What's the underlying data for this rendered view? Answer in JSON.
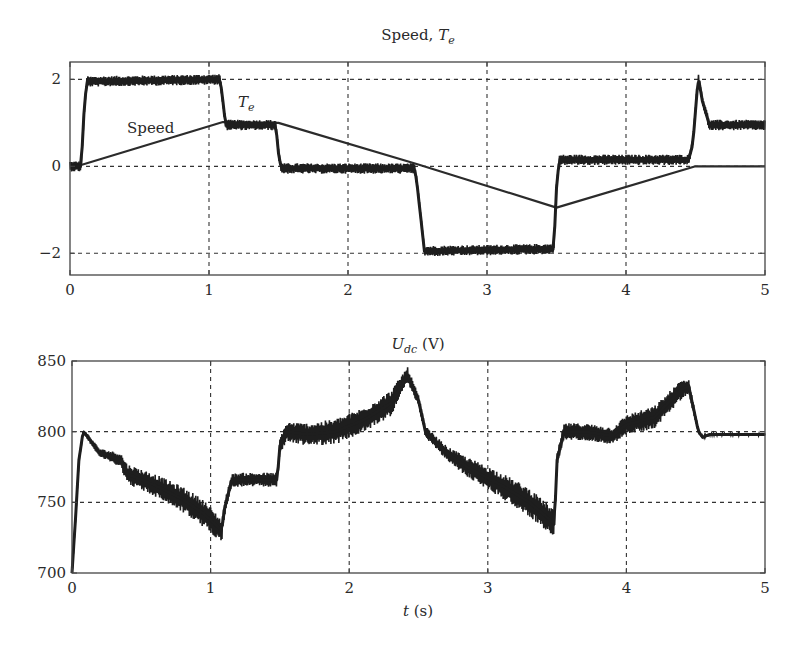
{
  "chart_data": [
    {
      "type": "line",
      "title": "Speed, T_e",
      "title_parts": {
        "main": "Speed, ",
        "symbol": "T",
        "subscript": "e"
      },
      "xlabel": "",
      "ylabel": "",
      "xlim": [
        0,
        5
      ],
      "ylim": [
        -2.5,
        2.4
      ],
      "xticks": [
        "0",
        "1",
        "2",
        "3",
        "4",
        "5"
      ],
      "yticks": [
        {
          "value": 2,
          "label": "2"
        },
        {
          "value": 0,
          "label": "0"
        },
        {
          "value": -2,
          "label": "−2"
        }
      ],
      "grid": true,
      "grid_style": "dashed",
      "annotations": [
        {
          "text": "Speed",
          "x": 0.55,
          "y": 0.85
        },
        {
          "text": "T",
          "subscript": "e",
          "x": 1.18,
          "y": 1.55
        }
      ],
      "series": [
        {
          "name": "Speed",
          "style": "thin",
          "x": [
            0,
            0.05,
            1.1,
            1.5,
            2.5,
            3.5,
            4.5,
            5.0
          ],
          "y": [
            0,
            0,
            1.02,
            1.0,
            0.05,
            -0.95,
            0,
            0
          ]
        },
        {
          "name": "T_e",
          "style": "noisy",
          "noise": 0.12,
          "x": [
            0,
            0.08,
            0.1,
            0.12,
            1.08,
            1.1,
            1.12,
            1.48,
            1.5,
            1.52,
            2.48,
            2.5,
            2.55,
            3.48,
            3.5,
            3.52,
            4.45,
            4.48,
            4.52,
            4.55,
            4.6,
            4.65,
            5.0
          ],
          "y": [
            0,
            0,
            1.2,
            1.95,
            2.0,
            1.5,
            0.95,
            0.95,
            0.3,
            -0.05,
            -0.05,
            -0.5,
            -1.95,
            -1.9,
            -0.5,
            0.15,
            0.15,
            0.5,
            2.05,
            1.5,
            0.95,
            0.95,
            0.95
          ]
        }
      ]
    },
    {
      "type": "line",
      "title": "U_dc (V)",
      "title_parts": {
        "symbol": "U",
        "subscript": "dc",
        "unit": " (V)"
      },
      "xlabel": "t (s)",
      "xlabel_parts": {
        "symbol": "t",
        "unit": " (s)"
      },
      "ylabel": "",
      "xlim": [
        0,
        5
      ],
      "ylim": [
        700,
        850
      ],
      "xticks": [
        "0",
        "1",
        "2",
        "3",
        "4",
        "5"
      ],
      "yticks": [
        {
          "value": 850,
          "label": "850"
        },
        {
          "value": 800,
          "label": "800"
        },
        {
          "value": 750,
          "label": "750"
        },
        {
          "value": 700,
          "label": "700"
        }
      ],
      "grid": true,
      "grid_style": "dashed",
      "series": [
        {
          "name": "U_dc",
          "style": "noisy",
          "x": [
            0,
            0.02,
            0.05,
            0.08,
            0.1,
            0.2,
            0.35,
            0.4,
            0.6,
            0.8,
            0.95,
            1.08,
            1.1,
            1.15,
            1.2,
            1.48,
            1.5,
            1.55,
            1.7,
            1.9,
            2.1,
            2.3,
            2.42,
            2.5,
            2.55,
            2.7,
            2.85,
            3.1,
            3.3,
            3.48,
            3.5,
            3.55,
            3.7,
            3.9,
            4.0,
            4.2,
            4.4,
            4.45,
            4.52,
            4.55,
            4.6,
            5.0
          ],
          "y": [
            700,
            730,
            780,
            800,
            798,
            785,
            780,
            770,
            762,
            752,
            742,
            730,
            745,
            765,
            766,
            766,
            790,
            800,
            798,
            800,
            808,
            820,
            840,
            822,
            800,
            785,
            775,
            762,
            750,
            735,
            780,
            800,
            800,
            797,
            805,
            810,
            830,
            832,
            800,
            796,
            798,
            798
          ],
          "band": [
            2,
            2,
            2,
            1,
            2,
            3,
            5,
            7,
            8,
            9,
            10,
            8,
            5,
            5,
            5,
            5,
            6,
            7,
            8,
            9,
            9,
            9,
            6,
            4,
            4,
            5,
            7,
            9,
            10,
            10,
            5,
            6,
            6,
            6,
            7,
            8,
            7,
            5,
            2,
            1,
            1,
            1
          ]
        }
      ]
    }
  ]
}
